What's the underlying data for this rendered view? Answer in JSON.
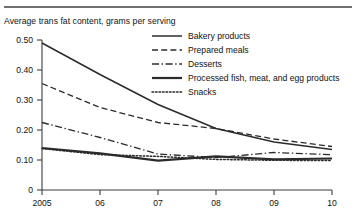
{
  "figure": {
    "title": "Average trans fat content, grams per serving"
  },
  "chart_data": {
    "type": "line",
    "title": "Average trans fat content, grams per serving",
    "xlabel": "",
    "ylabel": "",
    "grid": false,
    "legend_position": "top-right-inside",
    "x": [
      2005,
      2006,
      2007,
      2008,
      2009,
      2010
    ],
    "xtick_labels": [
      "2005",
      "06",
      "07",
      "08",
      "09",
      "10"
    ],
    "ytick_labels": [
      "0",
      "0.10",
      "0.20",
      "0.30",
      "0.40",
      "0.50"
    ],
    "ytick_values": [
      0,
      0.1,
      0.2,
      0.3,
      0.4,
      0.5
    ],
    "xlim": [
      2005,
      2010
    ],
    "ylim": [
      0,
      0.5
    ],
    "series": [
      {
        "name": "Bakery products",
        "style": "solid",
        "values": [
          0.49,
          0.385,
          0.285,
          0.205,
          0.16,
          0.135
        ]
      },
      {
        "name": "Prepared meals",
        "style": "dashed",
        "values": [
          0.355,
          0.275,
          0.225,
          0.205,
          0.17,
          0.145
        ]
      },
      {
        "name": "Desserts",
        "style": "dash-dot",
        "values": [
          0.225,
          0.175,
          0.12,
          0.108,
          0.125,
          0.118
        ]
      },
      {
        "name": "Processed fish, meat, and egg products",
        "style": "solid-thick",
        "values": [
          0.14,
          0.122,
          0.098,
          0.112,
          0.102,
          0.105
        ]
      },
      {
        "name": "Snacks",
        "style": "dotted",
        "values": [
          0.138,
          0.118,
          0.112,
          0.102,
          0.099,
          0.098
        ]
      }
    ]
  },
  "legend": {
    "items": [
      {
        "label": "Bakery products"
      },
      {
        "label": "Prepared meals"
      },
      {
        "label": "Desserts"
      },
      {
        "label": "Processed fish, meat, and egg products"
      },
      {
        "label": "Snacks"
      }
    ]
  }
}
